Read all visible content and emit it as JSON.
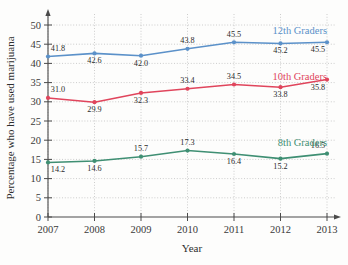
{
  "chart_data": {
    "type": "line",
    "title": "",
    "xlabel": "Year",
    "ylabel": "Percentage who have used marijuana",
    "categories": [
      "2007",
      "2008",
      "2009",
      "2010",
      "2011",
      "2012",
      "2013"
    ],
    "x": [
      2007,
      2008,
      2009,
      2010,
      2011,
      2012,
      2013
    ],
    "xlim": [
      2007,
      2013
    ],
    "ylim": [
      0,
      50
    ],
    "yticks": [
      0,
      5,
      10,
      15,
      20,
      25,
      30,
      35,
      40,
      45,
      50
    ],
    "ytick_labels": [
      "0",
      "5",
      "10",
      "15",
      "20",
      "25",
      "30",
      "35",
      "40",
      "45",
      "50"
    ],
    "grid": true,
    "legend_position": "inline-right",
    "series": [
      {
        "name": "12th Graders",
        "color": "#5b91c9",
        "values": [
          41.8,
          42.6,
          42.0,
          43.8,
          45.5,
          45.2,
          45.5
        ],
        "value_labels": [
          "41.8",
          "42.6",
          "42.0",
          "43.8",
          "45.5",
          "45.2",
          "45.5"
        ]
      },
      {
        "name": "10th Graders",
        "color": "#e0455c",
        "values": [
          31.0,
          29.9,
          32.3,
          33.4,
          34.5,
          33.8,
          35.8
        ],
        "value_labels": [
          "31.0",
          "29.9",
          "32.3",
          "33.4",
          "34.5",
          "33.8",
          "35.8"
        ]
      },
      {
        "name": "8th Graders",
        "color": "#3f8f73",
        "values": [
          14.2,
          14.6,
          15.7,
          17.3,
          16.4,
          15.2,
          16.5
        ],
        "value_labels": [
          "14.2",
          "14.6",
          "15.7",
          "17.3",
          "16.4",
          "15.2",
          "16.5"
        ]
      }
    ],
    "axis_color": "#4a4a4a",
    "grid_color": "#b8b8b8"
  }
}
